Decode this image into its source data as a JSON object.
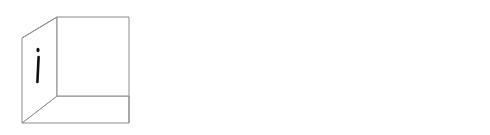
{
  "figure": {
    "background_color": "#ffffff",
    "edge_color": "#8c8c8c",
    "hidden_edge_color": "#b9b9b9",
    "glyph_color": "#111111",
    "arrow_color": "#1f1f1f",
    "cursor_color": "#808080"
  },
  "cubes": [
    {
      "id": "left-cube",
      "name": "cube-left",
      "style": "open",
      "faces": {
        "front": "ٱ",
        "left": "i",
        "right": "",
        "top": "",
        "bottom": "ں"
      },
      "face_labels": {
        "front": "dotted-alef-hook",
        "left": "i",
        "right": "",
        "top": "",
        "bottom": "noon-ghunna"
      }
    },
    {
      "id": "middle-cube",
      "name": "cube-middle",
      "style": "wireframe",
      "faces": {
        "front": "ل",
        "left": "i",
        "inner_front": "f",
        "right": "ʋ",
        "top": "ty",
        "bottom": "ں"
      },
      "face_labels": {
        "front": "lam-hook",
        "left": "i",
        "inner_front": "f",
        "right": "v-hook",
        "top": "ty",
        "bottom": "noon-ghunna"
      }
    },
    {
      "id": "right-cube",
      "name": "cube-right",
      "style": "solid",
      "faces": {
        "front": "f",
        "left": "",
        "right": "ʋ",
        "top": "ty",
        "bottom": ""
      },
      "face_labels": {
        "front": "f",
        "right": "v-hook",
        "top": "ty"
      }
    }
  ],
  "arrows": [
    {
      "id": "arrow-left",
      "name": "arrow-left",
      "direction": "left",
      "color": "#1f1f1f",
      "label": ""
    },
    {
      "id": "arrow-right",
      "name": "arrow-right",
      "direction": "right",
      "color": "#1f1f1f",
      "label": ""
    }
  ],
  "cursor": {
    "name": "mouse-cursor",
    "shape": "arrow-left",
    "color": "#808080",
    "label": ""
  }
}
